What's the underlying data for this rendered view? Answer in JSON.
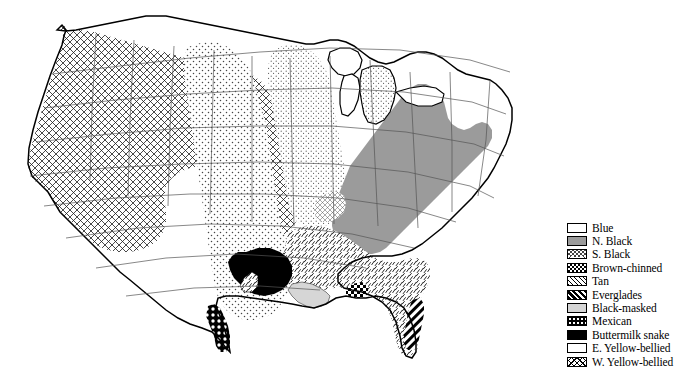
{
  "figure": {
    "type": "distribution-map",
    "region": "Continental United States",
    "background_color": "#ffffff",
    "line_color": "#000000"
  },
  "map": {
    "name": "united-states-range-map",
    "outline_color": "#000000",
    "state_border_color": "#555555",
    "regions": [
      {
        "id": "west",
        "label": "W. Yellow-bellied",
        "pattern": "crosshatch-x",
        "description": "Pacific states and Great Basin: WA, OR, CA, NV, ID, MT, WY, UT, western CO"
      },
      {
        "id": "great-plains",
        "label": "Blue",
        "pattern": "fine-dots",
        "description": "Plains and midwest: ND, SD, NE, KS, OK, TX, IA, MO, AR"
      },
      {
        "id": "great-lakes",
        "label": "E. Yellow-bellied",
        "pattern": "sparse-stipple",
        "description": "Great Lakes and upper midwest: MN, WI, MI, IL, IN, OH, KY"
      },
      {
        "id": "northeast",
        "label": "N. Black",
        "pattern": "solid-gray",
        "description": "Appalachians and northeast: NY, PA, NJ, NE states, WV, VA, NC, TN, northern GA, northern AL"
      },
      {
        "id": "appalachian",
        "label": "S. Black",
        "pattern": "light-crosshatch",
        "description": "Southern Appalachian fringe"
      },
      {
        "id": "southeast",
        "label": "Tan",
        "pattern": "diagonal-hatch",
        "description": "Gulf and south Atlantic coastal plain: MS, AL, GA, FL, SC, LA"
      },
      {
        "id": "s-florida",
        "label": "Everglades",
        "pattern": "bold-diagonal",
        "description": "Southeastern Florida / Everglades"
      },
      {
        "id": "gulf-coast",
        "label": "Brown-chinned",
        "pattern": "checkerboard",
        "description": "Small patch on the Alabama/Florida Gulf coast"
      },
      {
        "id": "louisiana",
        "label": "Black-masked",
        "pattern": "light-gray",
        "description": "Southern Louisiana"
      },
      {
        "id": "east-texas",
        "label": "Buttermilk snake",
        "pattern": "solid-black",
        "description": "East Texas blob"
      },
      {
        "id": "s-texas",
        "label": "Mexican",
        "pattern": "dotted-checker",
        "description": "South Texas coastal strip toward the Rio Grande"
      }
    ]
  },
  "legend": {
    "name": "pattern-legend",
    "position": "right",
    "items": [
      {
        "label": "Blue",
        "pattern": "fine-dots",
        "swatch_class": "p-blue"
      },
      {
        "label": "N. Black",
        "pattern": "solid-gray",
        "swatch_class": "p-nblack"
      },
      {
        "label": "S. Black",
        "pattern": "light-crosshatch",
        "swatch_class": "p-sblack"
      },
      {
        "label": "Brown-chinned",
        "pattern": "checkerboard",
        "swatch_class": "p-brownchinned"
      },
      {
        "label": "Tan",
        "pattern": "diagonal-hatch",
        "swatch_class": "p-tan"
      },
      {
        "label": "Everglades",
        "pattern": "bold-diagonal",
        "swatch_class": "p-everglades"
      },
      {
        "label": "Black-masked",
        "pattern": "light-gray",
        "swatch_class": "p-blackmasked"
      },
      {
        "label": "Mexican",
        "pattern": "dotted-checker",
        "swatch_class": "p-mexican"
      },
      {
        "label": "Buttermilk snake",
        "pattern": "solid-black",
        "swatch_class": "p-buttermilk"
      },
      {
        "label": "E. Yellow-bellied",
        "pattern": "sparse-stipple",
        "swatch_class": "p-eyellow"
      },
      {
        "label": "W. Yellow-bellied",
        "pattern": "crosshatch-x",
        "swatch_class": "p-wyellow"
      }
    ]
  }
}
